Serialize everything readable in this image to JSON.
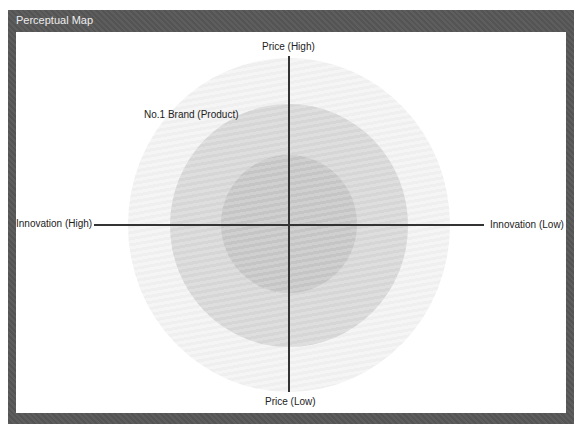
{
  "panel": {
    "title": "Perceptual Map"
  },
  "map": {
    "axes": {
      "top": "Price (High)",
      "bottom": "Price (Low)",
      "left": "Innovation (High)",
      "right": "Innovation (Low)"
    },
    "rings": [
      {
        "name": "outer",
        "color": "#f4f4f4"
      },
      {
        "name": "middle",
        "color": "#dadada"
      },
      {
        "name": "inner",
        "color": "#c9c9c9"
      }
    ],
    "annotation": "No.1 Brand (Product)"
  },
  "colors": {
    "frame": "#575757",
    "axis": "#333333"
  }
}
